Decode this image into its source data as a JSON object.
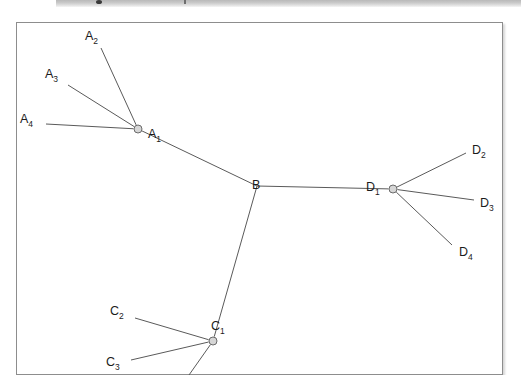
{
  "figure": {
    "kind": "node-link-diagram",
    "background_color": "#ffffff",
    "frame": {
      "border_color": "#8d8d8d",
      "fill_color": "#ffffff",
      "x": 16,
      "y": 22,
      "width": 487,
      "height": 353
    },
    "edge_color": "#5a5a5a",
    "node_fill_color": "#d6d6d6",
    "node_stroke_color": "#6b6b6b"
  },
  "nodes": [
    {
      "id": "A1",
      "label": "A",
      "sub": "1",
      "x": 138,
      "y": 129,
      "has_circle": true,
      "label_x": 148,
      "label_y": 128
    },
    {
      "id": "A2",
      "label": "A",
      "sub": "2",
      "x": 101,
      "y": 48,
      "has_circle": false,
      "label_x": 85,
      "label_y": 30
    },
    {
      "id": "A3",
      "label": "A",
      "sub": "3",
      "x": 68,
      "y": 85,
      "has_circle": false,
      "label_x": 45,
      "label_y": 68
    },
    {
      "id": "A4",
      "label": "A",
      "sub": "4",
      "x": 46,
      "y": 124,
      "has_circle": false,
      "label_x": 20,
      "label_y": 113
    },
    {
      "id": "B",
      "label": "B",
      "sub": "",
      "x": 257,
      "y": 186,
      "has_circle": false,
      "label_x": 252,
      "label_y": 179
    },
    {
      "id": "C1",
      "label": "C",
      "sub": "1",
      "x": 213,
      "y": 341,
      "has_circle": true,
      "label_x": 211,
      "label_y": 320
    },
    {
      "id": "C2",
      "label": "C",
      "sub": "2",
      "x": 135,
      "y": 318,
      "has_circle": false,
      "label_x": 110,
      "label_y": 305
    },
    {
      "id": "C3",
      "label": "C",
      "sub": "3",
      "x": 131,
      "y": 360,
      "has_circle": false,
      "label_x": 106,
      "label_y": 356
    },
    {
      "id": "C4",
      "label": "",
      "sub": "",
      "x": 189,
      "y": 375,
      "has_circle": false,
      "label_x": 0,
      "label_y": 0
    },
    {
      "id": "D1",
      "label": "D",
      "sub": "1",
      "x": 393,
      "y": 189,
      "has_circle": true,
      "label_x": 366,
      "label_y": 181
    },
    {
      "id": "D2",
      "label": "D",
      "sub": "2",
      "x": 466,
      "y": 153,
      "has_circle": false,
      "label_x": 472,
      "label_y": 144
    },
    {
      "id": "D3",
      "label": "D",
      "sub": "3",
      "x": 474,
      "y": 200,
      "has_circle": false,
      "label_x": 480,
      "label_y": 197
    },
    {
      "id": "D4",
      "label": "D",
      "sub": "4",
      "x": 452,
      "y": 245,
      "has_circle": false,
      "label_x": 459,
      "label_y": 246
    }
  ],
  "edges": [
    {
      "from": "A2",
      "to": "A1"
    },
    {
      "from": "A3",
      "to": "A1"
    },
    {
      "from": "A4",
      "to": "A1"
    },
    {
      "from": "A1",
      "to": "B"
    },
    {
      "from": "B",
      "to": "D1"
    },
    {
      "from": "B",
      "to": "C1"
    },
    {
      "from": "D1",
      "to": "D2"
    },
    {
      "from": "D1",
      "to": "D3"
    },
    {
      "from": "D1",
      "to": "D4"
    },
    {
      "from": "C2",
      "to": "C1"
    },
    {
      "from": "C3",
      "to": "C1"
    },
    {
      "from": "C1",
      "to": "C4"
    }
  ]
}
